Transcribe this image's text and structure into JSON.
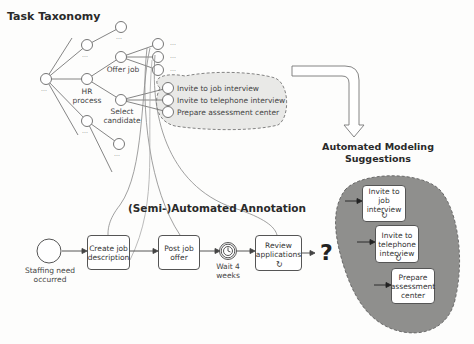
{
  "titles": {
    "taxonomy": "Task Taxonomy",
    "annotation": "(Semi-)Automated Annotation",
    "suggestions_line1": "Automated Modeling",
    "suggestions_line2": "Suggestions"
  },
  "taxonomy": {
    "ellipsis": "...",
    "hr_process": [
      "HR",
      "process"
    ],
    "offer_job": "Offer job",
    "select_candidate": [
      "Select",
      "candidate"
    ],
    "candidate_children": [
      "Invite to job interview",
      "Invite to telephone interview",
      "Prepare assessment center"
    ]
  },
  "process": {
    "start_event": [
      "Staffing need",
      "occurred"
    ],
    "tasks": [
      {
        "label": [
          "Create job",
          "description"
        ]
      },
      {
        "label": [
          "Post job offer"
        ]
      },
      {
        "label": [
          "Review",
          "applications"
        ],
        "loop": true
      }
    ],
    "timer_event": [
      "Wait 4",
      "weeks"
    ],
    "unknown_next": "?"
  },
  "suggestions": [
    {
      "label": [
        "Invite to job",
        "interview"
      ],
      "loop": true
    },
    {
      "label": [
        "Invite to",
        "telephone",
        "interview"
      ],
      "loop": true
    },
    {
      "label": [
        "Prepare",
        "assessment",
        "center"
      ],
      "loop": false
    }
  ],
  "colors": {
    "cloud_fill": "#e9e9e7",
    "blob_fill": "#8f8f8d",
    "line": "#555555"
  }
}
